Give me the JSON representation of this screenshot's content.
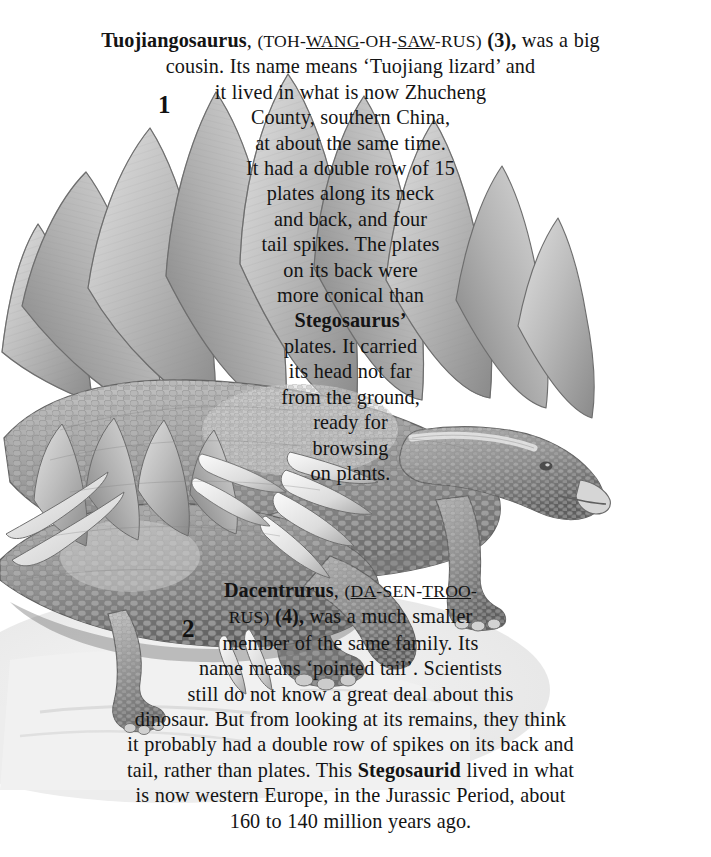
{
  "page": {
    "background_color": "#ffffff",
    "text_color": "#141414",
    "width": 711,
    "height": 857
  },
  "illustration": {
    "description": "Grayscale pencil illustration of two stegosaurid dinosaurs",
    "labels": [
      {
        "id": "label-1",
        "text": "1",
        "subject": "Tuojiangosaurus"
      },
      {
        "id": "label-2",
        "text": "2",
        "subject": "Dacentrurus"
      }
    ],
    "palette": {
      "plate_light": "#d8d8d8",
      "plate_mid": "#a9a9a9",
      "plate_dark": "#7d7d7d",
      "skin_light": "#c4c4c4",
      "skin_mid": "#9b9b9b",
      "skin_dark": "#6f6f6f",
      "outline": "#5a5a5a",
      "ground": "#ececec",
      "spike": "#efefef"
    }
  },
  "block1": {
    "title": "Tuojiangosaurus",
    "pronunciation": {
      "open": "(",
      "syllables": [
        {
          "text": "TOH",
          "stressed": false
        },
        {
          "text": "WANG",
          "stressed": true
        },
        {
          "text": "OH",
          "stressed": false
        },
        {
          "text": "SAW",
          "stressed": true
        },
        {
          "text": "RUS",
          "stressed": false
        }
      ],
      "close": ")"
    },
    "ref": "(3),",
    "lines": [
      "Tuojiangosaurus, (TOH-WANG-OH-SAW-RUS) (3), was a big",
      "cousin. Its name means ‘Tuojiang lizard’ and",
      "it lived in what is now Zhucheng",
      "County, southern China,",
      "at about the same time.",
      "It had a double row of 15",
      "plates along its neck",
      "and back, and four",
      "tail spikes. The plates",
      "on its back were",
      "more conical than",
      "Stegosaurus’",
      "plates. It carried",
      "its head not far",
      "from the ground,",
      "ready for",
      "browsing",
      "on plants."
    ],
    "line_text": {
      "l1_a": "was a big",
      "l2": "cousin. Its name means ‘Tuojiang lizard’ and",
      "l3": "it lived in what is now Zhucheng",
      "l4": "County, southern China,",
      "l5": "at about the same time.",
      "l6": "It had a double row of 15",
      "l7": "plates along its neck",
      "l8": "and back, and four",
      "l9": "tail spikes. The plates",
      "l10": "on its back were",
      "l11": "more conical than",
      "l12_bold": "Stegosaurus’",
      "l13": "plates. It carried",
      "l14": "its head not far",
      "l15": "from the ground,",
      "l16": "ready for",
      "l17": "browsing",
      "l18": "on plants."
    }
  },
  "block2": {
    "title": "Dacentrurus",
    "pronunciation": {
      "open": "(",
      "syllables": [
        {
          "text": "DA",
          "stressed": true
        },
        {
          "text": "SEN",
          "stressed": false
        },
        {
          "text": "TROO",
          "stressed": true
        },
        {
          "text": "RUS",
          "stressed": false
        }
      ],
      "close": ")"
    },
    "ref": "(4),",
    "lines": [
      "Dacentrurus, (DA-SEN-TROO-",
      "RUS) (4), was a much smaller",
      "member of the same family. Its",
      "name means ‘pointed tail’. Scientists",
      "still do not know a great deal about this",
      "dinosaur. But from looking at its remains, they think",
      "it probably had a double row of spikes on its back and",
      "tail, rather than plates. This Stegosaurid lived in what",
      "is now western Europe, in the Jurassic Period, about",
      "160 to 140 million years ago."
    ],
    "line_text": {
      "l2_rest": "was a much smaller",
      "l3": "member of the same family. Its",
      "l4": "name means ‘pointed tail’. Scientists",
      "l5": "still do not know a great deal about this",
      "l6": "dinosaur. But from looking at its remains, they think",
      "l7": "it probably had a double row of spikes on its back and",
      "l8_a": "tail, rather than plates. This",
      "l8_bold": "Stegosaurid",
      "l8_b": "lived in what",
      "l9": "is now western Europe, in the Jurassic Period, about",
      "l10": "160 to 140 million years ago."
    }
  }
}
